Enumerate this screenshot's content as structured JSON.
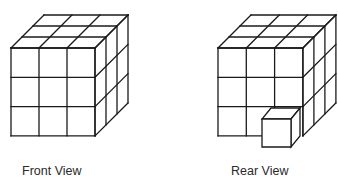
{
  "diagram": {
    "stroke_color": "#1a1a1a",
    "fill_color": "#ffffff",
    "stroke_width": 1.3,
    "views": [
      {
        "id": "front",
        "label": "Front View",
        "grid": 3,
        "origin": [
          11,
          48
        ],
        "cell_w": 28,
        "cell_h": 29.3,
        "depth_dx": 11,
        "depth_dy": -11,
        "removed_cell": null
      },
      {
        "id": "rear",
        "label": "Rear View",
        "grid": 3,
        "origin": [
          218,
          48
        ],
        "cell_w": 28.3,
        "cell_h": 29.3,
        "depth_dx": 11,
        "depth_dy": -11,
        "removed_cell": {
          "col": 2,
          "row": 2
        },
        "protruding_cube": {
          "front_left": 262,
          "front_top": 119,
          "width": 29,
          "height": 28,
          "depth_dx": 9,
          "depth_dy": -11
        }
      }
    ]
  }
}
